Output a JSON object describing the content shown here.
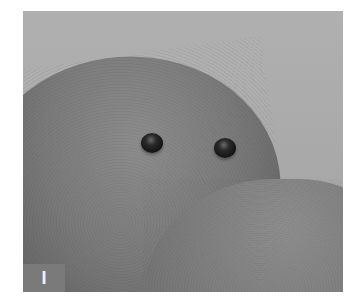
{
  "figure": {
    "panel_label": "I",
    "colors": {
      "background": "#a9a9a9",
      "skin_light": "#8c8c8c",
      "skin_dark": "#4a4a4a",
      "bead": "#141414",
      "label_box": "#7a7a7a",
      "label_text": "#f4f4f4"
    },
    "objects": [
      {
        "name": "upper-fingertip"
      },
      {
        "name": "lower-fingertip"
      },
      {
        "name": "bead-left"
      },
      {
        "name": "bead-right"
      }
    ]
  }
}
